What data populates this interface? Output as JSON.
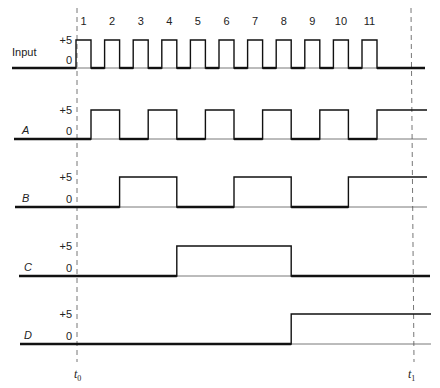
{
  "level_labels": {
    "high": "+5",
    "low": "0"
  },
  "time_markers": [
    {
      "name": "t0",
      "base": "t",
      "sub": "0",
      "x": 77
    },
    {
      "name": "t1",
      "base": "t",
      "sub": "1",
      "x": 411
    }
  ],
  "pulse_numbers": [
    "1",
    "2",
    "3",
    "4",
    "5",
    "6",
    "7",
    "8",
    "9",
    "10",
    "11"
  ],
  "pulse_timing": {
    "first_rise_x": 76,
    "period": 28.6,
    "width": 15
  },
  "signals": [
    {
      "name": "Input",
      "italic": false,
      "label_x": 12,
      "high_y": 40,
      "low_y": 68,
      "start_x": 12,
      "end_x": 425,
      "initial": 0,
      "transitions": [
        76,
        91,
        104.6,
        119.6,
        133.2,
        148.2,
        161.8,
        176.8,
        190.4,
        205.4,
        219,
        234,
        247.6,
        262.6,
        276.2,
        291.2,
        304.8,
        319.8,
        333.4,
        348.4,
        362,
        377
      ]
    },
    {
      "name": "A",
      "italic": true,
      "label_x": 22,
      "high_y": 110,
      "low_y": 139,
      "start_x": 14,
      "end_x": 427,
      "initial": 0,
      "transitions": [
        91,
        119.6,
        148.2,
        176.8,
        205.4,
        234,
        262.6,
        291.2,
        319.8,
        348.4,
        377
      ]
    },
    {
      "name": "B",
      "italic": true,
      "label_x": 22,
      "high_y": 177,
      "low_y": 207,
      "start_x": 15,
      "end_x": 427,
      "initial": 0,
      "transitions": [
        119.6,
        176.8,
        234,
        291.2,
        348.4
      ]
    },
    {
      "name": "C",
      "italic": true,
      "label_x": 24,
      "high_y": 246,
      "low_y": 276,
      "start_x": 19,
      "end_x": 430,
      "initial": 0,
      "transitions": [
        176.8,
        291.2
      ]
    },
    {
      "name": "D",
      "italic": true,
      "label_x": 24,
      "high_y": 314,
      "low_y": 344,
      "start_x": 20,
      "end_x": 431,
      "initial": 0,
      "transitions": [
        291.2
      ]
    }
  ],
  "chart_data": {
    "type": "timing",
    "title": "",
    "signals": [
      {
        "name": "Input",
        "description": "11 clock pulses, 0 to +5 V",
        "edges_high": [
          1,
          2,
          3,
          4,
          5,
          6,
          7,
          8,
          9,
          10,
          11
        ]
      },
      {
        "name": "A",
        "state_after_pulse": [
          1,
          0,
          1,
          0,
          1,
          0,
          1,
          0,
          1,
          0,
          1
        ]
      },
      {
        "name": "B",
        "state_after_pulse": [
          0,
          1,
          1,
          0,
          0,
          1,
          1,
          0,
          0,
          1,
          1
        ]
      },
      {
        "name": "C",
        "state_after_pulse": [
          0,
          0,
          0,
          1,
          1,
          1,
          1,
          0,
          0,
          0,
          0
        ]
      },
      {
        "name": "D",
        "state_after_pulse": [
          0,
          0,
          0,
          0,
          0,
          0,
          0,
          1,
          1,
          1,
          1
        ]
      }
    ],
    "levels": [
      "0",
      "+5"
    ],
    "markers": [
      "t0",
      "t1"
    ],
    "pulse_labels": [
      "1",
      "2",
      "3",
      "4",
      "5",
      "6",
      "7",
      "8",
      "9",
      "10",
      "11"
    ]
  }
}
